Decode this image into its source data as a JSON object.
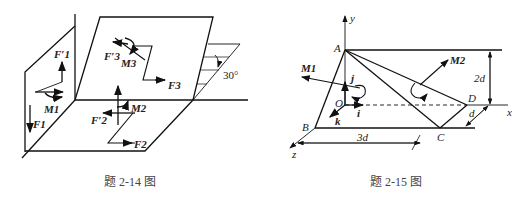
{
  "figures": [
    {
      "id": "fig-2-14",
      "caption": "题 2-14 图",
      "labels": {
        "F1p": "F′1",
        "F1": "F1",
        "M1": "M1",
        "F2p": "F′2",
        "F2": "F2",
        "M2": "M2",
        "F3p": "F′3",
        "F3": "F3",
        "M3": "M3",
        "angle": "30°"
      }
    },
    {
      "id": "fig-2-15",
      "caption": "题 2-15 图",
      "labels": {
        "y": "y",
        "x": "x",
        "z": "z",
        "A": "A",
        "B": "B",
        "C": "C",
        "D": "D",
        "O": "O",
        "i": "i",
        "j": "j",
        "k": "k",
        "M1": "M1",
        "M2": "M2",
        "dim_2d": "2d",
        "dim_3d": "3d",
        "dim_d": "d"
      }
    }
  ]
}
